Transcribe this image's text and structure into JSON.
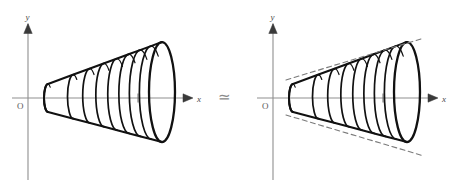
{
  "figure": {
    "kind": "mathematical-diagram",
    "relation_symbol": "≃",
    "background_color": "#ffffff",
    "ink_color": "#111111",
    "axis_color": "#8f8f8f",
    "dash_color": "#7a7a7a"
  },
  "panels": [
    {
      "id": "left",
      "name": "solid-of-revolution-plain",
      "axes": {
        "x_label": "x",
        "y_label": "y",
        "origin_label": "O",
        "origin": {
          "x": 28,
          "y": 98
        },
        "x_axis_end": {
          "x": 192,
          "y": 98
        },
        "y_axis_top": {
          "x": 28,
          "y": 16
        },
        "y_axis_bottom": {
          "x": 28,
          "y": 180
        },
        "x_tick": {
          "x": 138,
          "y": 98
        }
      },
      "shape": {
        "type": "stacked-ellipse-cone",
        "apex_x": 48,
        "mouth_x": 162,
        "ellipse_count": 9,
        "apex_half_height": 14,
        "mouth_half_height": 50,
        "ellipse_rx_apex": 4,
        "ellipse_rx_mouth": 13,
        "axis_tilt_deg": -3
      },
      "tangents": []
    },
    {
      "id": "right",
      "name": "solid-of-revolution-with-tangents",
      "axes": {
        "x_label": "x",
        "y_label": "y",
        "origin_label": "O",
        "origin": {
          "x": 273,
          "y": 98
        },
        "x_axis_end": {
          "x": 437,
          "y": 98
        },
        "y_axis_top": {
          "x": 273,
          "y": 16
        },
        "y_axis_bottom": {
          "x": 273,
          "y": 180
        },
        "x_tick": {
          "x": 383,
          "y": 98
        }
      },
      "shape": {
        "type": "stacked-ellipse-cone",
        "apex_x": 293,
        "mouth_x": 407,
        "ellipse_count": 9,
        "apex_half_height": 14,
        "mouth_half_height": 50,
        "ellipse_rx_apex": 4,
        "ellipse_rx_mouth": 13,
        "axis_tilt_deg": -3
      },
      "tangents": [
        {
          "name": "upper-asymptote",
          "style": "dashed",
          "from": {
            "x": 286,
            "y": 80
          },
          "to": {
            "x": 424,
            "y": 38
          }
        },
        {
          "name": "lower-asymptote",
          "style": "dashed",
          "from": {
            "x": 286,
            "y": 115
          },
          "to": {
            "x": 424,
            "y": 156
          }
        }
      ]
    }
  ]
}
